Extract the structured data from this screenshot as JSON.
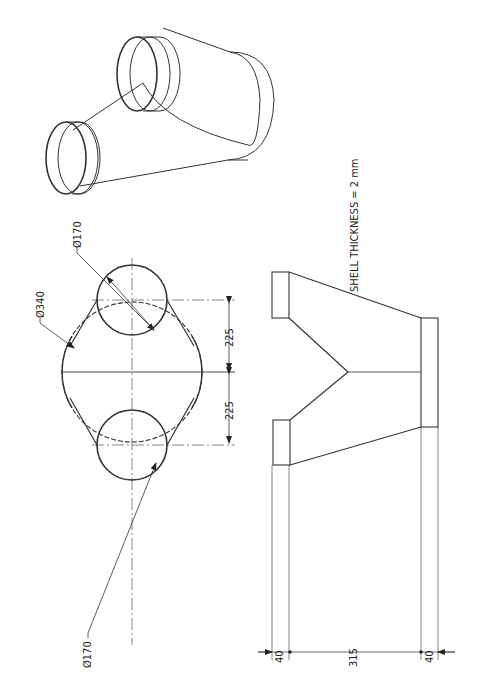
{
  "drawing": {
    "isometric_view": {
      "title": "Y-branch isometric view"
    },
    "note": "SHELL THICKNESS = 2 mm",
    "top_view": {
      "large_diameter_label": "Ø340",
      "small_diameter_label_top": "Ø170",
      "small_diameter_label_bottom": "Ø170",
      "offset_upper": "225",
      "offset_lower": "225"
    },
    "side_view": {
      "dim_left": "40",
      "dim_middle": "315",
      "dim_right": "40"
    },
    "colors": {
      "line": "#222222",
      "thin_line": "#555555",
      "background": "#ffffff"
    }
  }
}
